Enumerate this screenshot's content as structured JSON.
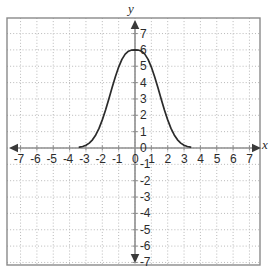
{
  "figure": {
    "axis_label_x": "x",
    "axis_label_y": "y",
    "frame_color": "#8a8a8a",
    "grid_color": "#b9b9b9",
    "axis_color": "#8f8f8f",
    "curve_color": "#2b2b2b",
    "tick_text_color": "#2b2b2b"
  },
  "x_ticks": [
    "-7",
    "-6",
    "-5",
    "-4",
    "-3",
    "-2",
    "-1",
    "0",
    "1",
    "2",
    "3",
    "4",
    "5",
    "6",
    "7"
  ],
  "y_ticks": [
    "7",
    "6",
    "5",
    "4",
    "3",
    "2",
    "1",
    "0",
    "-1",
    "-2",
    "-3",
    "-4",
    "-5",
    "-6",
    "-7"
  ],
  "chart_data": {
    "type": "line",
    "title": "",
    "xlabel": "x",
    "ylabel": "y",
    "xlim": [
      -7.5,
      7.5
    ],
    "ylim": [
      -7.5,
      7.5
    ],
    "grid": true,
    "legend": "none",
    "x_tick_values": [
      -7,
      -6,
      -5,
      -4,
      -3,
      -2,
      -1,
      0,
      1,
      2,
      3,
      4,
      5,
      6,
      7
    ],
    "y_tick_values": [
      7,
      6,
      5,
      4,
      3,
      2,
      1,
      0,
      -1,
      -2,
      -3,
      -4,
      -5,
      -6,
      -7
    ],
    "series": [
      {
        "name": "bell curve",
        "description": "Gaussian-shaped bell curve, peak y=6 at x=0, approaching y=0 near x=-3 and x=3",
        "peak": {
          "x": 0,
          "y": 6
        },
        "x": [
          -3.4,
          -3.2,
          -3.0,
          -2.8,
          -2.6,
          -2.4,
          -2.2,
          -2.0,
          -1.8,
          -1.6,
          -1.4,
          -1.2,
          -1.0,
          -0.8,
          -0.6,
          -0.4,
          -0.2,
          0.0,
          0.2,
          0.4,
          0.6,
          0.8,
          1.0,
          1.2,
          1.4,
          1.6,
          1.8,
          2.0,
          2.2,
          2.4,
          2.6,
          2.8,
          3.0,
          3.2,
          3.4
        ],
        "y": [
          0.05,
          0.09,
          0.17,
          0.3,
          0.5,
          0.8,
          1.2,
          1.72,
          2.33,
          3.0,
          3.7,
          4.36,
          4.95,
          5.42,
          5.74,
          5.92,
          5.99,
          6.0,
          5.99,
          5.92,
          5.74,
          5.42,
          4.95,
          4.36,
          3.7,
          3.0,
          2.33,
          1.72,
          1.2,
          0.8,
          0.5,
          0.3,
          0.17,
          0.09,
          0.05
        ]
      }
    ]
  }
}
